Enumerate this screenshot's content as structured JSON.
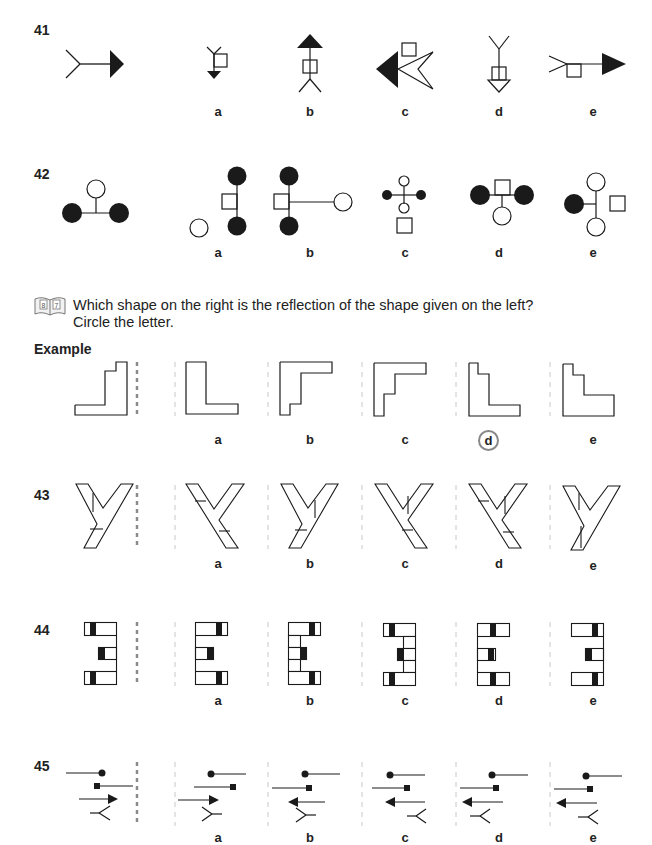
{
  "questions_top": [
    {
      "number": "41",
      "options": [
        {
          "label": "a"
        },
        {
          "label": "b"
        },
        {
          "label": "c"
        },
        {
          "label": "d"
        },
        {
          "label": "e"
        }
      ]
    },
    {
      "number": "42",
      "options": [
        {
          "label": "a"
        },
        {
          "label": "b"
        },
        {
          "label": "c"
        },
        {
          "label": "d"
        },
        {
          "label": "e"
        }
      ]
    }
  ],
  "section": {
    "icon": "book-icon",
    "icon_pages": [
      "8",
      "7"
    ],
    "instruction_line1": "Which shape on the right is the reflection of the shape given on the left?",
    "instruction_line2": "Circle the letter."
  },
  "example": {
    "title": "Example",
    "options": [
      {
        "label": "a"
      },
      {
        "label": "b"
      },
      {
        "label": "c"
      },
      {
        "label": "d",
        "circled": true
      },
      {
        "label": "e"
      }
    ],
    "answer": "d"
  },
  "questions_bottom": [
    {
      "number": "43",
      "options": [
        {
          "label": "a"
        },
        {
          "label": "b"
        },
        {
          "label": "c"
        },
        {
          "label": "d"
        },
        {
          "label": "e"
        }
      ]
    },
    {
      "number": "44",
      "options": [
        {
          "label": "a"
        },
        {
          "label": "b"
        },
        {
          "label": "c"
        },
        {
          "label": "d"
        },
        {
          "label": "e"
        }
      ]
    },
    {
      "number": "45",
      "options": [
        {
          "label": "a"
        },
        {
          "label": "b"
        },
        {
          "label": "c"
        },
        {
          "label": "d"
        },
        {
          "label": "e"
        }
      ]
    }
  ],
  "colors": {
    "ink": "#1a1a1a",
    "mirror_line_bold": "#8a8a8a",
    "mirror_line_light": "#c8c8c8",
    "circle_answer": "#888888"
  }
}
